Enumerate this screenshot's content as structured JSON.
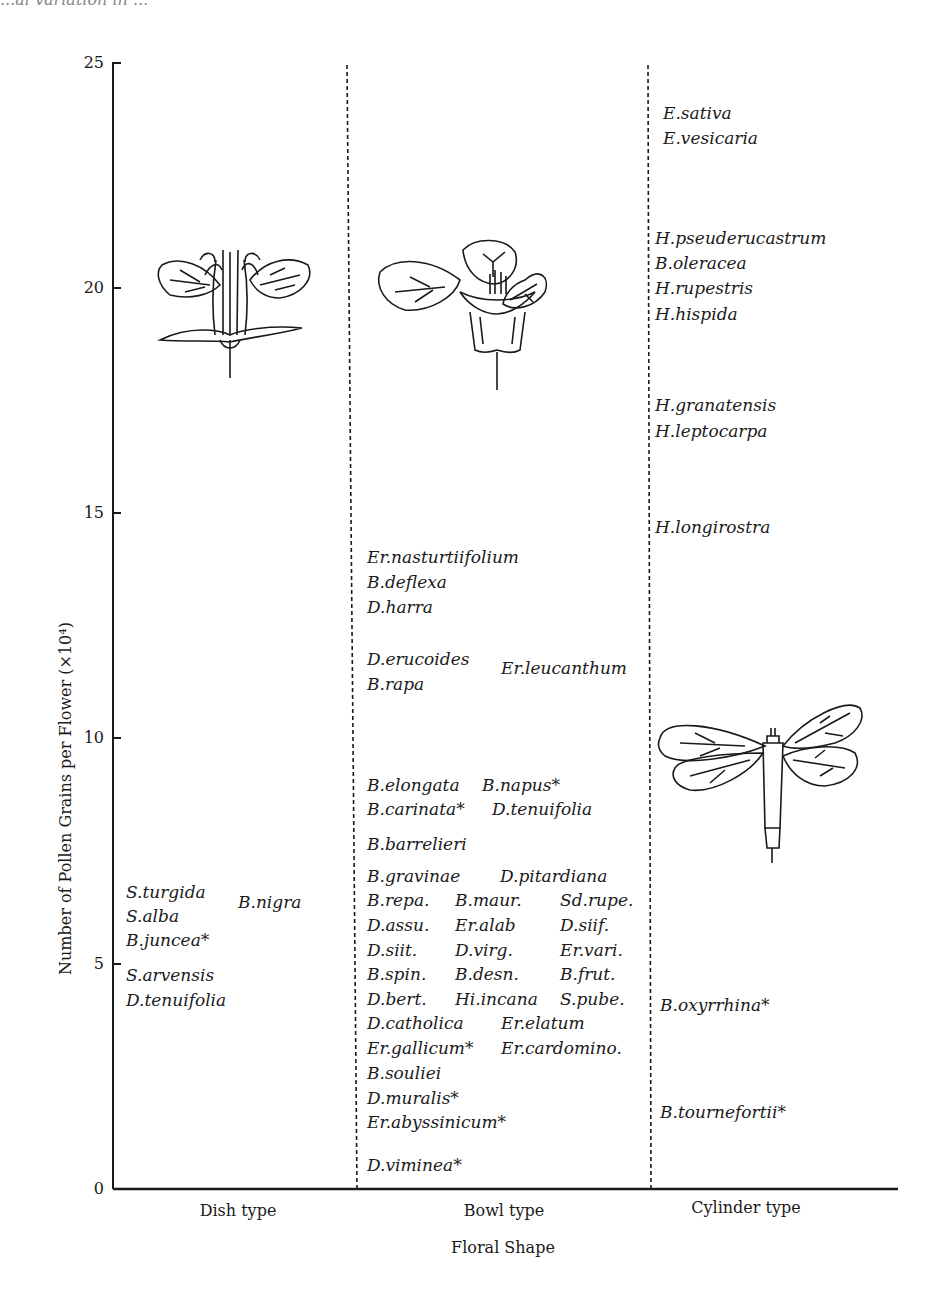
{
  "chart_data": {
    "type": "scatter",
    "title": "",
    "xlabel": "Floral Shape",
    "ylabel": "Number of Pollen Grains per Flower (×10⁴)",
    "ylim": [
      0,
      25
    ],
    "yticks": [
      "0",
      "5",
      "10",
      "15",
      "20",
      "25"
    ],
    "categories": [
      "Dish type",
      "Bowl type",
      "Cylinder type"
    ],
    "grid": false,
    "series": [
      {
        "name": "Dish type",
        "points": [
          {
            "label": "S.turgida",
            "y": 7.0
          },
          {
            "label": "B.nigra",
            "y": 6.6
          },
          {
            "label": "S.alba",
            "y": 6.5
          },
          {
            "label": "B.juncea*",
            "y": 6.0
          },
          {
            "label": "S.arvensis",
            "y": 5.1
          },
          {
            "label": "D.tenuifolia",
            "y": 4.6
          }
        ]
      },
      {
        "name": "Bowl type",
        "points": [
          {
            "label": "Er.nasturtiifolium",
            "y": 14.0
          },
          {
            "label": "B.deflexa",
            "y": 13.4
          },
          {
            "label": "D.harra",
            "y": 12.9
          },
          {
            "label": "D.erucoides",
            "y": 11.8
          },
          {
            "label": "Er.leucanthum",
            "y": 11.5
          },
          {
            "label": "B.rapa",
            "y": 11.3
          },
          {
            "label": "B.elongata",
            "y": 8.6
          },
          {
            "label": "B.napus*",
            "y": 8.6
          },
          {
            "label": "B.carinata*",
            "y": 8.1
          },
          {
            "label": "D.tenuifolia",
            "y": 8.1
          },
          {
            "label": "B.barrelieri",
            "y": 7.4
          },
          {
            "label": "B.gravinae",
            "y": 6.8
          },
          {
            "label": "D.pitardiana",
            "y": 6.8
          },
          {
            "label": "B.repa.",
            "y": 6.3
          },
          {
            "label": "B.maur.",
            "y": 6.3
          },
          {
            "label": "Sd.rupe.",
            "y": 6.3
          },
          {
            "label": "D.assu.",
            "y": 5.8
          },
          {
            "label": "Er.alab",
            "y": 5.8
          },
          {
            "label": "D.siif.",
            "y": 5.8
          },
          {
            "label": "D.siit.",
            "y": 5.2
          },
          {
            "label": "D.virg.",
            "y": 5.2
          },
          {
            "label": "Er.vari.",
            "y": 5.2
          },
          {
            "label": "B.spin.",
            "y": 4.7
          },
          {
            "label": "B.desn.",
            "y": 4.7
          },
          {
            "label": "B.frut.",
            "y": 4.7
          },
          {
            "label": "D.bert.",
            "y": 4.1
          },
          {
            "label": "Hi.incana",
            "y": 4.1
          },
          {
            "label": "S.pube.",
            "y": 4.1
          },
          {
            "label": "D.catholica",
            "y": 3.6
          },
          {
            "label": "Er.elatum",
            "y": 3.6
          },
          {
            "label": "Er.gallicum*",
            "y": 3.0
          },
          {
            "label": "Er.cardomino.",
            "y": 3.0
          },
          {
            "label": "B.souliei",
            "y": 2.4
          },
          {
            "label": "D.muralis*",
            "y": 1.9
          },
          {
            "label": "Er.abyssinicum*",
            "y": 1.4
          },
          {
            "label": "D.viminea*",
            "y": 0.4
          }
        ]
      },
      {
        "name": "Cylinder type",
        "points": [
          {
            "label": "E.sativa",
            "y": 24.1
          },
          {
            "label": "E.vesicaria",
            "y": 23.5
          },
          {
            "label": "H.pseuderucastrum",
            "y": 21.2
          },
          {
            "label": "B.oleracea",
            "y": 20.6
          },
          {
            "label": "H.rupestris",
            "y": 20.0
          },
          {
            "label": "H.hispida",
            "y": 19.4
          },
          {
            "label": "H.granatensis",
            "y": 17.5
          },
          {
            "label": "H.leptocarpa",
            "y": 16.9
          },
          {
            "label": "H.longirostra",
            "y": 15.4
          },
          {
            "label": "B.oxyrrhina*",
            "y": 4.1
          },
          {
            "label": "B.tournefortii*",
            "y": 1.7
          }
        ]
      }
    ],
    "annotations": [
      "dish-type flower illustration",
      "bowl-type flower illustration",
      "cylinder-type flower illustration",
      "* marks selected species"
    ]
  },
  "page": {
    "top_partial_text": "...al variation in ...",
    "xlabel": "Floral Shape",
    "ylabel": "Number of Pollen Grains per Flower (×10⁴)",
    "yticks": {
      "t0": "0",
      "t5": "5",
      "t10": "10",
      "t15": "15",
      "t20": "20",
      "t25": "25"
    },
    "categories": {
      "dish": "Dish type",
      "bowl": "Bowl type",
      "cylinder": "Cylinder type"
    }
  },
  "labels": {
    "dish": [
      {
        "text": "S.turgida",
        "x": 126,
        "y": 882
      },
      {
        "text": "S.alba",
        "x": 126,
        "y": 906
      },
      {
        "text": "B.juncea*",
        "x": 126,
        "y": 930
      },
      {
        "text": "S.arvensis",
        "x": 126,
        "y": 965
      },
      {
        "text": "D.tenuifolia",
        "x": 126,
        "y": 990
      },
      {
        "text": "B.nigra",
        "x": 238,
        "y": 892
      }
    ],
    "bowl": [
      {
        "text": "Er.nasturtiifolium",
        "x": 367,
        "y": 547
      },
      {
        "text": "B.deflexa",
        "x": 367,
        "y": 572
      },
      {
        "text": "D.harra",
        "x": 367,
        "y": 597
      },
      {
        "text": "D.erucoides",
        "x": 367,
        "y": 649
      },
      {
        "text": "B.rapa",
        "x": 367,
        "y": 674
      },
      {
        "text": "Er.leucanthum",
        "x": 501,
        "y": 658
      },
      {
        "text": "B.elongata",
        "x": 367,
        "y": 775
      },
      {
        "text": "B.napus*",
        "x": 482,
        "y": 775
      },
      {
        "text": "B.carinata*",
        "x": 367,
        "y": 799
      },
      {
        "text": "D.tenuifolia",
        "x": 492,
        "y": 799
      },
      {
        "text": "B.barrelieri",
        "x": 367,
        "y": 834
      },
      {
        "text": "B.gravinae",
        "x": 367,
        "y": 866
      },
      {
        "text": "D.pitardiana",
        "x": 500,
        "y": 866
      },
      {
        "text": "B.repa.",
        "x": 367,
        "y": 890
      },
      {
        "text": "B.maur.",
        "x": 455,
        "y": 890
      },
      {
        "text": "Sd.rupe.",
        "x": 560,
        "y": 890
      },
      {
        "text": "D.assu.",
        "x": 367,
        "y": 915
      },
      {
        "text": "Er.alab",
        "x": 455,
        "y": 915
      },
      {
        "text": "D.siif.",
        "x": 560,
        "y": 915
      },
      {
        "text": "D.siit.",
        "x": 367,
        "y": 940
      },
      {
        "text": "D.virg.",
        "x": 455,
        "y": 940
      },
      {
        "text": "Er.vari.",
        "x": 560,
        "y": 940
      },
      {
        "text": "B.spin.",
        "x": 367,
        "y": 964
      },
      {
        "text": "B.desn.",
        "x": 455,
        "y": 964
      },
      {
        "text": "B.frut.",
        "x": 560,
        "y": 964
      },
      {
        "text": "D.bert.",
        "x": 367,
        "y": 989
      },
      {
        "text": "Hi.incana",
        "x": 455,
        "y": 989
      },
      {
        "text": "S.pube.",
        "x": 560,
        "y": 989
      },
      {
        "text": "D.catholica",
        "x": 367,
        "y": 1013
      },
      {
        "text": "Er.elatum",
        "x": 501,
        "y": 1013
      },
      {
        "text": "Er.gallicum*",
        "x": 367,
        "y": 1038
      },
      {
        "text": "Er.cardomino.",
        "x": 501,
        "y": 1038
      },
      {
        "text": "B.souliei",
        "x": 367,
        "y": 1063
      },
      {
        "text": "D.muralis*",
        "x": 367,
        "y": 1088
      },
      {
        "text": "Er.abyssinicum*",
        "x": 367,
        "y": 1112
      },
      {
        "text": "D.viminea*",
        "x": 367,
        "y": 1155
      }
    ],
    "cylinder": [
      {
        "text": "E.sativa",
        "x": 663,
        "y": 103
      },
      {
        "text": "E.vesicaria",
        "x": 663,
        "y": 128
      },
      {
        "text": "H.pseuderucastrum",
        "x": 655,
        "y": 228
      },
      {
        "text": "B.oleracea",
        "x": 655,
        "y": 253
      },
      {
        "text": "H.rupestris",
        "x": 655,
        "y": 278
      },
      {
        "text": "H.hispida",
        "x": 655,
        "y": 304
      },
      {
        "text": "H.granatensis",
        "x": 655,
        "y": 395
      },
      {
        "text": "H.leptocarpa",
        "x": 655,
        "y": 421
      },
      {
        "text": "H.longirostra",
        "x": 655,
        "y": 517
      },
      {
        "text": "B.oxyrrhina*",
        "x": 660,
        "y": 995
      },
      {
        "text": "B.tournefortii*",
        "x": 660,
        "y": 1102
      }
    ]
  }
}
